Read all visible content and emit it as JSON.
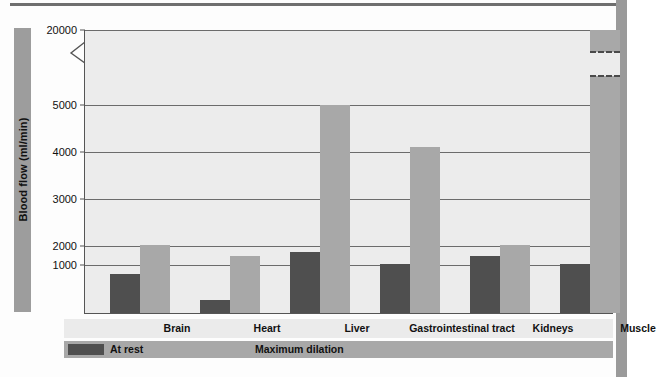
{
  "chart_data": {
    "type": "bar",
    "title": "",
    "xlabel": "",
    "ylabel": "Blood flow (ml/min)",
    "categories": [
      "Brain",
      "Heart",
      "Liver",
      "Gastrointestinal tract",
      "Kidneys",
      "Muscle"
    ],
    "series": [
      {
        "name": "At rest",
        "color": "#4f4f4f",
        "values": [
          750,
          250,
          1300,
          1050,
          1200,
          1050
        ]
      },
      {
        "name": "Maximum dilation",
        "color": "#a8a8a8",
        "values": [
          1450,
          1200,
          5000,
          4100,
          1450,
          21000
        ]
      }
    ],
    "ytick_labels": [
      "20000",
      "5000",
      "4000",
      "3000",
      "2000",
      "1000"
    ],
    "ytick_values": [
      20000,
      5000,
      4000,
      3000,
      2000,
      1000
    ],
    "ylim": [
      0,
      20000
    ],
    "axis_break": {
      "between": [
        5000,
        20000
      ],
      "style": "zigzag"
    },
    "bar_break": {
      "category": "Muscle",
      "series": "Maximum dilation",
      "style": "dashed"
    },
    "grid": "horizontal",
    "legend_position": "bottom"
  },
  "axis": {
    "y_title": "Blood flow (ml/min)",
    "ticks": [
      {
        "label": "20000",
        "top_px": 0
      },
      {
        "label": "5000",
        "top_px": 75
      },
      {
        "label": "4000",
        "top_px": 122
      },
      {
        "label": "3000",
        "top_px": 169
      },
      {
        "label": "2000",
        "top_px": 216
      },
      {
        "label": "1000",
        "top_px": 235
      }
    ]
  },
  "categories": [
    {
      "label": "Brain",
      "center_px": 113
    },
    {
      "label": "Heart",
      "center_px": 203
    },
    {
      "label": "Liver",
      "center_px": 293
    },
    {
      "label": "Gastrointestinal tract",
      "center_px": 398
    },
    {
      "label": "Kidneys",
      "center_px": 489
    },
    {
      "label": "Muscle",
      "center_px": 574
    }
  ],
  "bars": [
    {
      "group": "Brain",
      "series": "At rest",
      "value": 750,
      "left_px": 25,
      "width_px": 30,
      "height_px": 39
    },
    {
      "group": "Brain",
      "series": "Maximum dilation",
      "value": 1450,
      "left_px": 55,
      "width_px": 30,
      "height_px": 68
    },
    {
      "group": "Heart",
      "series": "At rest",
      "value": 250,
      "left_px": 115,
      "width_px": 30,
      "height_px": 13
    },
    {
      "group": "Heart",
      "series": "Maximum dilation",
      "value": 1200,
      "left_px": 145,
      "width_px": 30,
      "height_px": 57
    },
    {
      "group": "Liver",
      "series": "At rest",
      "value": 1300,
      "left_px": 205,
      "width_px": 30,
      "height_px": 61
    },
    {
      "group": "Liver",
      "series": "Maximum dilation",
      "value": 5000,
      "left_px": 235,
      "width_px": 30,
      "height_px": 208
    },
    {
      "group": "Gastrointestinal tract",
      "series": "At rest",
      "value": 1050,
      "left_px": 295,
      "width_px": 30,
      "height_px": 49
    },
    {
      "group": "Gastrointestinal tract",
      "series": "Maximum dilation",
      "value": 4100,
      "left_px": 325,
      "width_px": 30,
      "height_px": 166
    },
    {
      "group": "Kidneys",
      "series": "At rest",
      "value": 1200,
      "left_px": 385,
      "width_px": 30,
      "height_px": 57
    },
    {
      "group": "Kidneys",
      "series": "Maximum dilation",
      "value": 1450,
      "left_px": 415,
      "width_px": 30,
      "height_px": 68
    },
    {
      "group": "Muscle",
      "series": "At rest",
      "value": 1050,
      "left_px": 475,
      "width_px": 30,
      "height_px": 49
    },
    {
      "group": "Muscle",
      "series": "Maximum dilation",
      "value": 21000,
      "left_px": 505,
      "width_px": 30,
      "height_px": 283
    }
  ],
  "legend": {
    "items": [
      {
        "label": "At rest",
        "color": "#4f4f4f",
        "left_px": 46
      },
      {
        "label": "Maximum dilation",
        "color": "#a8a8a8",
        "left_px": 191
      }
    ]
  },
  "colors": {
    "at_rest": "#4f4f4f",
    "max_dilation": "#a8a8a8",
    "plot_background": "#ececec",
    "gridline": "#6b6b6b",
    "band_background": "#a8a8a8",
    "category_band": "#ebebeb"
  }
}
